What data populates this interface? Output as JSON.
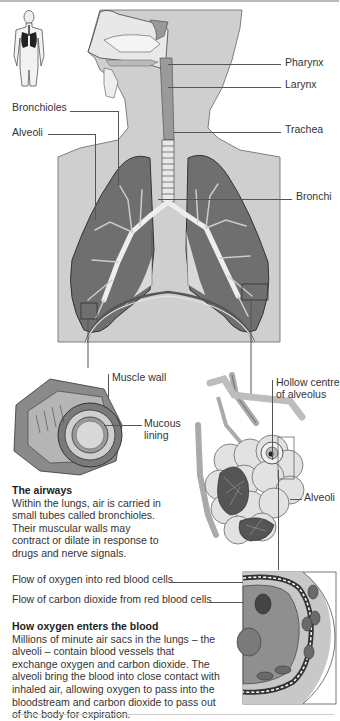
{
  "diagram": {
    "colors": {
      "body_fill": "#cfcfcf",
      "lung_fill": "#6f6f6f",
      "lung_dark": "#4a4a4a",
      "airway_light": "#e6e6e6",
      "leader_line": "#555555",
      "text": "#333333",
      "background": "#ffffff"
    },
    "labels": {
      "pharynx": "Pharynx",
      "larynx": "Larynx",
      "bronchioles": "Bronchioles",
      "alveoli_top": "Alveoli",
      "trachea": "Trachea",
      "bronchi": "Bronchi",
      "muscle_wall": "Muscle wall",
      "mucous_lining_1": "Mucous",
      "mucous_lining_2": "lining",
      "hollow_centre_1": "Hollow centre",
      "hollow_centre_2": "of alveolus",
      "alveoli_cluster": "Alveoli",
      "flow_oxygen": "Flow of oxygen into red blood cells",
      "flow_co2": "Flow of carbon dioxide from red blood cells"
    },
    "airways": {
      "heading": "The airways",
      "body": "Within the lungs, air is carried in small tubes called bronchioles. Their muscular walls may contract or dilate in response to drugs and nerve signals."
    },
    "oxygen": {
      "heading": "How oxygen enters the blood",
      "body": "Millions of minute air sacs in the lungs – the alveoli – contain blood vessels that exchange oxygen and carbon dioxide. The alveoli bring the blood into close contact with inhaled air, allowing oxygen to pass into the bloodstream and carbon dioxide to pass out of the body for expiration."
    },
    "icons": {
      "thumbnail": "body-figure-icon",
      "lungs": "lungs-illustration",
      "bronchiole_section": "bronchiole-cross-section",
      "alveoli_cluster": "alveoli-cluster-illustration",
      "alveolus_detail": "alveolus-capillary-detail"
    }
  }
}
